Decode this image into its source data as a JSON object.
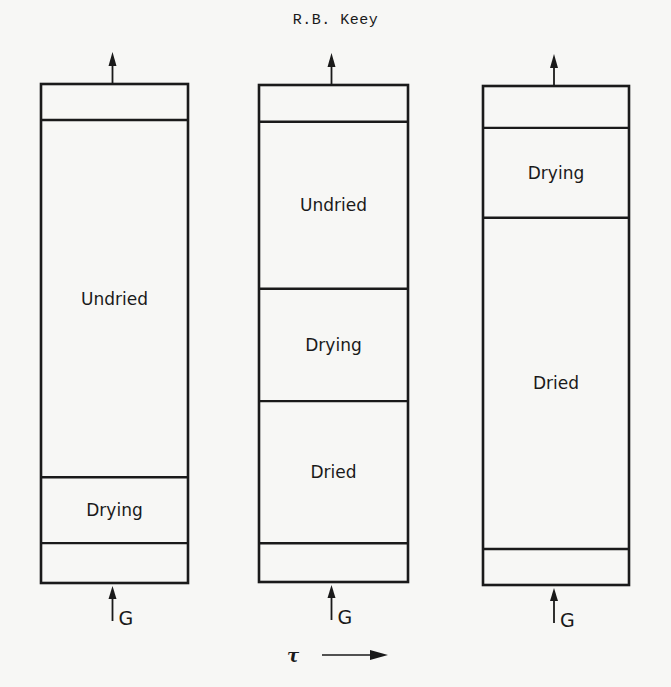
{
  "header": {
    "author": "R.B. Keey"
  },
  "figure": {
    "colors": {
      "ink": "#1a1a1a",
      "paper": "#f7f7f5"
    },
    "time_axis": {
      "symbol": "τ",
      "arrow": "right-arrow"
    },
    "columns": [
      {
        "id": "stage-1",
        "inlet_label": "G",
        "zones": [
          {
            "name": "headspace",
            "label": "",
            "fraction": 0.072
          },
          {
            "name": "undried",
            "label": "Undried",
            "fraction": 0.716
          },
          {
            "name": "drying",
            "label": "Drying",
            "fraction": 0.132
          },
          {
            "name": "plenum",
            "label": "",
            "fraction": 0.08
          }
        ]
      },
      {
        "id": "stage-2",
        "inlet_label": "G",
        "zones": [
          {
            "name": "headspace",
            "label": "",
            "fraction": 0.074
          },
          {
            "name": "undried",
            "label": "Undried",
            "fraction": 0.336
          },
          {
            "name": "drying",
            "label": "Drying",
            "fraction": 0.226
          },
          {
            "name": "dried",
            "label": "Dried",
            "fraction": 0.286
          },
          {
            "name": "plenum",
            "label": "",
            "fraction": 0.078
          }
        ]
      },
      {
        "id": "stage-3",
        "inlet_label": "G",
        "zones": [
          {
            "name": "headspace",
            "label": "",
            "fraction": 0.084
          },
          {
            "name": "drying",
            "label": "Drying",
            "fraction": 0.18
          },
          {
            "name": "dried",
            "label": "Dried",
            "fraction": 0.664
          },
          {
            "name": "plenum",
            "label": "",
            "fraction": 0.072
          }
        ]
      }
    ]
  }
}
